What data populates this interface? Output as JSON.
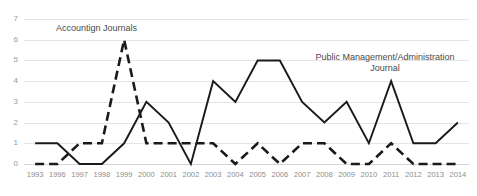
{
  "chart_data": {
    "type": "line",
    "title": "",
    "xlabel": "",
    "ylabel": "",
    "ylim": [
      0,
      7
    ],
    "yticks": [
      0,
      1,
      2,
      3,
      4,
      5,
      6,
      7
    ],
    "grid": true,
    "legend": "inline-annotations",
    "categories": [
      "1993",
      "1996",
      "1997",
      "1998",
      "1999",
      "2000",
      "2001",
      "2002",
      "2003",
      "2004",
      "2005",
      "2006",
      "2007",
      "2008",
      "2009",
      "2010",
      "2011",
      "2012",
      "2013",
      "2014"
    ],
    "series": [
      {
        "name": "Public Management/Administration Journal",
        "style": "solid",
        "color": "#1a1a1a",
        "values": [
          1,
          1,
          0,
          0,
          1,
          3,
          2,
          0,
          4,
          3,
          5,
          5,
          3,
          2,
          3,
          1,
          4,
          1,
          1,
          2
        ]
      },
      {
        "name": "Accountign Journals",
        "style": "dashed",
        "color": "#1a1a1a",
        "values": [
          0,
          0,
          1,
          1,
          6,
          1,
          1,
          1,
          1,
          0,
          1,
          0,
          1,
          1,
          0,
          0,
          1,
          0,
          0,
          0
        ]
      }
    ],
    "annotations": [
      {
        "id": "accounting",
        "text": "Accountign Journals"
      },
      {
        "id": "pma",
        "text": "Public Management/Administration Journal"
      }
    ]
  },
  "colors": {
    "gridline": "#e4e4e4",
    "axis": "#d6d6d6",
    "tick_text": "#9a9a9a",
    "annotation_text": "#4a4a4a",
    "series_line": "#1a1a1a",
    "background": "#ffffff"
  }
}
